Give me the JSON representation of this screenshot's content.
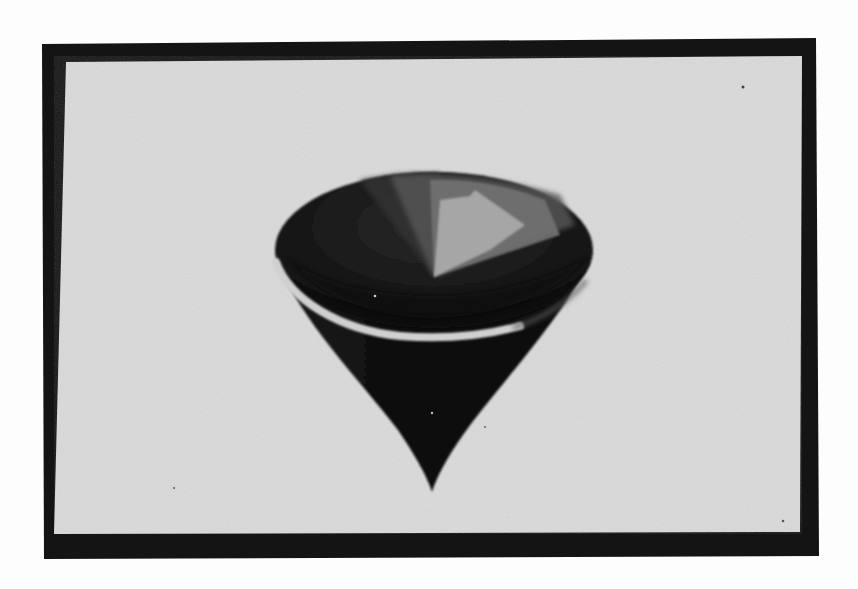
{
  "scene": {
    "description": "Photograph of a CRT monitor displaying a shaded 3D inverted cone (spinning-top shape)",
    "subject": "shaded 3D cone rendering"
  },
  "colors": {
    "page_background": "#fdfdfd",
    "monitor_bezel": "#141414",
    "screen_background": "#dcdcdc",
    "cone_dark": "#0e0e0e",
    "cone_mid": "#3a3a3a",
    "cone_facet_1": "#555555",
    "cone_facet_2": "#757575",
    "cone_highlight": "#a8a8a8",
    "rim_band": "#d2d2d2"
  },
  "geometry": {
    "bezel": {
      "points": "42,44 816,38 819,556 44,559"
    },
    "screen": {
      "points": "66,62 802,56 800,532 54,534"
    },
    "cone_top_ellipse": {
      "cx": 434,
      "cy": 250,
      "rx": 159,
      "ry": 78
    },
    "cone_body": {
      "path": "M 278 262 C 300 320, 360 380, 398 430 C 415 455, 428 478, 432 492 C 436 478, 448 455, 468 428 C 500 385, 560 320, 590 262 Z"
    },
    "facet_mid": {
      "path": "M 434 277 L 360 180 Q 400 172 440 173 Z"
    },
    "facet_1": {
      "path": "M 434 277 L 390 176 Q 470 168 560 195 L 575 225 Z"
    },
    "facet_2": {
      "path": "M 434 277 L 430 180 Q 490 178 545 200 L 560 235 Z"
    },
    "facet_highlight": {
      "path": "M 434 277 L 440 200 L 470 196 L 475 190 L 525 225 L 490 250 Z"
    },
    "rim_band": {
      "path": "M 276 262 C 290 300, 340 330, 400 336 C 450 340, 490 334, 520 326"
    },
    "tip": {
      "x": 432,
      "y": 492
    }
  }
}
